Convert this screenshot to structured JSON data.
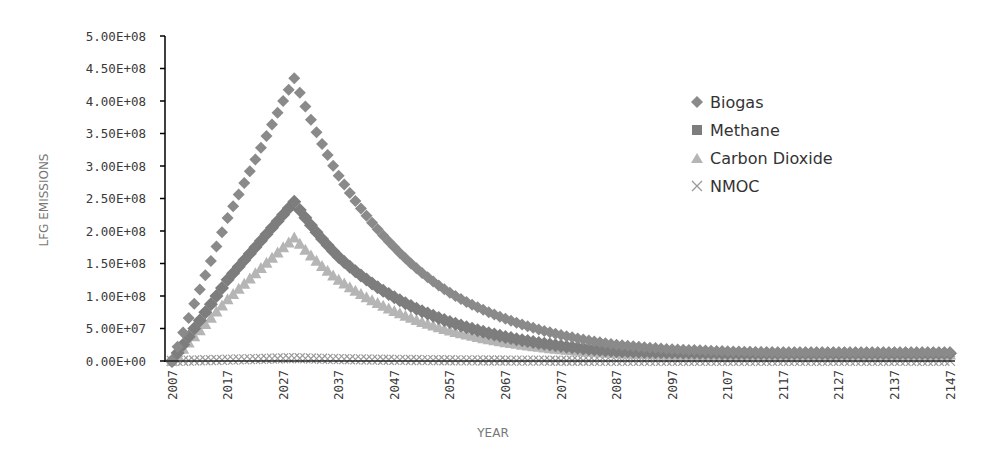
{
  "chart_data": {
    "type": "scatter",
    "title": "",
    "xlabel": "YEAR",
    "ylabel": "LFG EMISSIONS",
    "ylim": [
      0,
      500000000
    ],
    "xlim": [
      2007,
      2147
    ],
    "grid": false,
    "legend_position": "right",
    "y_tick_labels": [
      "0.00E+00",
      "5.00E+07",
      "1.00E+08",
      "1.50E+08",
      "2.00E+08",
      "2.50E+08",
      "3.00E+08",
      "3.50E+08",
      "4.00E+08",
      "4.50E+08",
      "5.00E+08"
    ],
    "x_tick_labels": [
      "2007",
      "2017",
      "2027",
      "2037",
      "2047",
      "2057",
      "2067",
      "2077",
      "2087",
      "2097",
      "2107",
      "2117",
      "2127",
      "2137",
      "2147"
    ],
    "x": [
      2007,
      2017,
      2027,
      2029,
      2037,
      2047,
      2057,
      2067,
      2077,
      2087,
      2097,
      2107,
      2117,
      2127,
      2137,
      2147
    ],
    "series": [
      {
        "name": "Biogas",
        "marker": "diamond",
        "color": "#8a8a8a",
        "values": [
          0,
          220000000,
          400000000,
          435000000,
          285000000,
          175000000,
          105000000,
          65000000,
          40000000,
          25000000,
          18000000,
          15000000,
          13000000,
          13000000,
          13000000,
          13000000
        ]
      },
      {
        "name": "Methane",
        "marker": "square",
        "color": "#7d7d7d",
        "values": [
          0,
          125000000,
          225000000,
          245000000,
          160000000,
          98000000,
          60000000,
          37000000,
          23000000,
          15000000,
          13000000,
          12000000,
          12000000,
          12000000,
          12000000,
          12000000
        ]
      },
      {
        "name": "Carbon Dioxide",
        "marker": "triangle",
        "color": "#b5b5b5",
        "values": [
          0,
          95000000,
          175000000,
          190000000,
          125000000,
          77000000,
          47000000,
          29000000,
          18000000,
          12000000,
          10000000,
          10000000,
          10000000,
          10000000,
          10000000,
          10000000
        ]
      },
      {
        "name": "NMOC",
        "marker": "x",
        "color": "#9a9a9a",
        "values": [
          0,
          2000000,
          4000000,
          4500000,
          3000000,
          1800000,
          1100000,
          700000,
          400000,
          250000,
          150000,
          100000,
          100000,
          100000,
          100000,
          100000
        ]
      }
    ]
  },
  "legend": {
    "items": [
      {
        "label": "Biogas"
      },
      {
        "label": "Methane"
      },
      {
        "label": "Carbon Dioxide"
      },
      {
        "label": "NMOC"
      }
    ]
  }
}
